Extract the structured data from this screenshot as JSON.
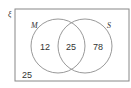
{
  "diagram": {
    "type": "venn",
    "universal_label": "ξ",
    "sets": [
      {
        "name": "M",
        "only": "12"
      },
      {
        "name": "S",
        "only": "78"
      }
    ],
    "intersection": "25",
    "outside": "25",
    "colors": {
      "stroke": "#888888",
      "text": "#333333",
      "background": "#ffffff"
    }
  }
}
